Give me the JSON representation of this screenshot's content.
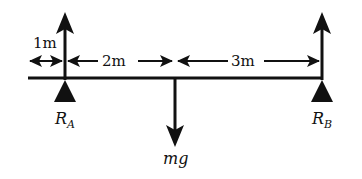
{
  "diagram": {
    "type": "beam-free-body",
    "colors": {
      "ink": "#111111",
      "background": "#ffffff"
    },
    "dimensions": [
      {
        "label": "1m",
        "from": "left-end",
        "to": "support-A"
      },
      {
        "label": "2m",
        "from": "support-A",
        "to": "weight-mg"
      },
      {
        "label": "3m",
        "from": "weight-mg",
        "to": "support-B"
      }
    ],
    "forces": {
      "ra": {
        "label_main": "R",
        "label_sub": "A",
        "direction": "up"
      },
      "rb": {
        "label_main": "R",
        "label_sub": "B",
        "direction": "up"
      },
      "mg": {
        "label": "mg",
        "direction": "down"
      }
    },
    "supports": [
      {
        "name": "A",
        "shape": "triangle"
      },
      {
        "name": "B",
        "shape": "triangle"
      }
    ]
  }
}
